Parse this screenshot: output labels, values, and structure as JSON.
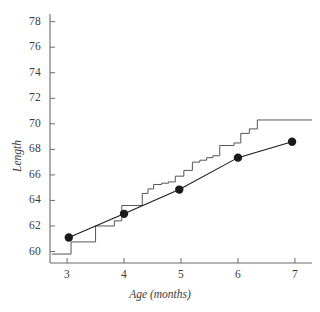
{
  "chart_data": {
    "type": "line",
    "title": "",
    "subtitle": "",
    "xlabel": "Age (months)",
    "ylabel": "Length",
    "xlim": [
      2.7,
      7.3
    ],
    "ylim": [
      59.1,
      78.6
    ],
    "xticks": [
      3,
      4,
      5,
      6,
      7
    ],
    "xtick_labels": [
      "3",
      "4",
      "5",
      "6",
      "7"
    ],
    "yticks": [
      60,
      62,
      64,
      66,
      68,
      70,
      72,
      74,
      76,
      78
    ],
    "ytick_labels": [
      "60",
      "62",
      "64",
      "66",
      "68",
      "70",
      "72",
      "74",
      "76",
      "78"
    ],
    "grid": false,
    "legend": null,
    "series": [
      {
        "name": "observed-means",
        "type": "line-with-markers",
        "marker": "filled-circle",
        "color": "#1a1a1a",
        "x": [
          3.03,
          4.0,
          4.97,
          6.0,
          6.95
        ],
        "values": [
          61.1,
          62.95,
          64.85,
          67.35,
          68.6
        ]
      },
      {
        "name": "step-function",
        "type": "step",
        "color": "#555555",
        "x": [
          2.73,
          3.07,
          3.07,
          3.2,
          3.2,
          3.5,
          3.5,
          3.62,
          3.62,
          3.83,
          3.83,
          3.96,
          3.96,
          4.1,
          4.1,
          4.32,
          4.32,
          4.42,
          4.42,
          4.52,
          4.52,
          4.66,
          4.66,
          4.78,
          4.78,
          4.9,
          4.9,
          5.05,
          5.05,
          5.2,
          5.2,
          5.33,
          5.33,
          5.45,
          5.45,
          5.56,
          5.56,
          5.68,
          5.68,
          5.8,
          5.8,
          5.93,
          5.93,
          6.05,
          6.05,
          6.2,
          6.2,
          6.34,
          6.34,
          6.5,
          6.5,
          7.3
        ],
        "values": [
          59.8,
          59.8,
          60.75,
          60.75,
          60.75,
          60.75,
          62.0,
          62.0,
          62.0,
          62.0,
          62.4,
          62.4,
          63.6,
          63.6,
          63.6,
          63.6,
          64.55,
          64.55,
          64.9,
          64.9,
          65.25,
          65.25,
          65.35,
          65.35,
          65.45,
          65.45,
          65.9,
          65.9,
          66.35,
          66.35,
          67.0,
          67.0,
          67.15,
          67.15,
          67.35,
          67.35,
          67.5,
          67.5,
          68.3,
          68.3,
          68.3,
          68.3,
          68.5,
          68.5,
          69.25,
          69.25,
          69.6,
          69.6,
          70.3,
          70.3,
          70.3,
          70.3
        ]
      }
    ],
    "axis_color": "#6b6b6b",
    "background_color": "#ffffff"
  },
  "axes": {
    "x_title": "Age (months)",
    "y_title": "Length"
  }
}
